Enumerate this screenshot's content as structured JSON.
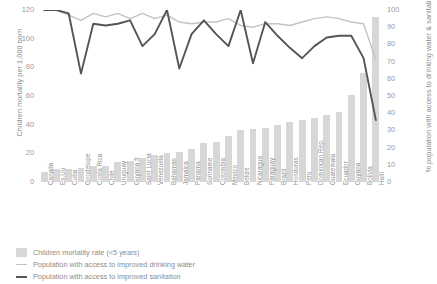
{
  "chart_data": {
    "type": "bar",
    "title": "",
    "categories": [
      "Canada",
      "Es.Uu",
      "Cuba",
      "Goodelupe",
      "Costa Rica",
      "Chile",
      "Uruguay",
      "Guyana fr",
      "Saint Lucia",
      "Venezuela",
      "Bahamas",
      "Jamaica",
      "Panama",
      "Suriname",
      "Colombia",
      "Mexico",
      "Belize",
      "Nicaragua",
      "Paraguay",
      "Brazil",
      "Honduras",
      "Peru",
      "Dominican Rep.",
      "Guatemala",
      "Ecuador",
      "Guyana",
      "Bolivia",
      "Haiti"
    ],
    "ylabel": "Children mortality per 1,000 born",
    "ylabel_right": "% population with access to drinking water & sanitation",
    "xlabel": "",
    "ylim": [
      0,
      120
    ],
    "ylim_right": [
      0,
      100
    ],
    "yticks": [
      0,
      20,
      40,
      60,
      80,
      100,
      120
    ],
    "yticks_right": [
      0,
      10,
      20,
      30,
      40,
      50,
      60,
      70,
      80,
      90,
      100
    ],
    "grid": false,
    "legend_position": "below",
    "series": [
      {
        "name": "Children mortality rate (<5 years)",
        "type": "bar",
        "axis": "left",
        "color": "#d7d7d7",
        "values": [
          7,
          9,
          9,
          10,
          11,
          11,
          14,
          15,
          17,
          19,
          20,
          21,
          23,
          27,
          28,
          32,
          36,
          37,
          38,
          40,
          42,
          43,
          45,
          47,
          49,
          61,
          76,
          115
        ]
      },
      {
        "name": "Population with access to improved drinking water",
        "type": "line",
        "axis": "right",
        "color": "#c3c3c3",
        "values": [
          100,
          100,
          97,
          94,
          98,
          96,
          98,
          95,
          98,
          95,
          97,
          93,
          92,
          93,
          93,
          95,
          91,
          90,
          92,
          92,
          91,
          93,
          95,
          96,
          95,
          93,
          92,
          71
        ]
      },
      {
        "name": "Population with access to improved sanitation",
        "type": "line",
        "axis": "right",
        "color": "#555555",
        "values": [
          100,
          100,
          98,
          63,
          92,
          91,
          92,
          94,
          79,
          86,
          100,
          66,
          86,
          94,
          86,
          79,
          100,
          69,
          93,
          85,
          78,
          72,
          79,
          84,
          85,
          85,
          72,
          36
        ]
      }
    ]
  },
  "legend": {
    "items": [
      {
        "label": "Children mortality rate (<5 years)",
        "marker": "bar-swatch"
      },
      {
        "label": "Population with access to improved drinking water",
        "marker": "line-light"
      },
      {
        "label": "Population with access to improved sanitation",
        "marker": "line-dark"
      }
    ]
  }
}
